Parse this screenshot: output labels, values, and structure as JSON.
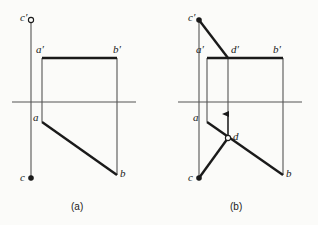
{
  "figure": {
    "background_color": "#fbfbf9",
    "ink_color": "#1a1a1a",
    "thin_line_color": "#555555",
    "captions": [
      {
        "text": "(a)",
        "x": 71,
        "y": 202
      },
      {
        "text": "(b)",
        "x": 230,
        "y": 202
      }
    ]
  },
  "panel_a": {
    "caption": "(a)",
    "labels": [
      {
        "name": "c-prime",
        "text": "c′",
        "x": 20,
        "y": 12
      },
      {
        "name": "a-prime",
        "text": "a′",
        "x": 36,
        "y": 44
      },
      {
        "name": "b-prime",
        "text": "b′",
        "x": 113,
        "y": 44
      },
      {
        "name": "a",
        "text": "a",
        "x": 33,
        "y": 112
      },
      {
        "name": "b",
        "text": "b",
        "x": 120,
        "y": 168
      },
      {
        "name": "c",
        "text": "c",
        "x": 20,
        "y": 172
      }
    ],
    "points": [
      {
        "name": "c-prime",
        "x": 31,
        "y": 20,
        "marker": "open-circle"
      },
      {
        "name": "a-prime",
        "x": 42,
        "y": 58,
        "marker": "none"
      },
      {
        "name": "b-prime",
        "x": 117,
        "y": 58,
        "marker": "none"
      },
      {
        "name": "a",
        "x": 42,
        "y": 122,
        "marker": "none"
      },
      {
        "name": "b",
        "x": 117,
        "y": 175,
        "marker": "none"
      },
      {
        "name": "c",
        "x": 31,
        "y": 178,
        "marker": "filled-circle"
      }
    ],
    "axis": {
      "name": "ground-line",
      "x1": 12,
      "y1": 102,
      "x2": 136,
      "y2": 102
    },
    "thin_lines": [
      {
        "name": "projector-c",
        "x1": 31,
        "y1": 20,
        "x2": 31,
        "y2": 178
      },
      {
        "name": "projector-a",
        "x1": 42,
        "y1": 58,
        "x2": 42,
        "y2": 122
      },
      {
        "name": "projector-b",
        "x1": 117,
        "y1": 58,
        "x2": 117,
        "y2": 175
      }
    ],
    "thick_lines": [
      {
        "name": "segment-a-prime-b-prime",
        "x1": 42,
        "y1": 58,
        "x2": 117,
        "y2": 58
      },
      {
        "name": "segment-a-b",
        "x1": 42,
        "y1": 122,
        "x2": 117,
        "y2": 175
      }
    ]
  },
  "panel_b": {
    "caption": "(b)",
    "labels": [
      {
        "name": "c-prime",
        "text": "c′",
        "x": 188,
        "y": 12
      },
      {
        "name": "a-prime",
        "text": "a′",
        "x": 196,
        "y": 44
      },
      {
        "name": "d-prime",
        "text": "d′",
        "x": 231,
        "y": 44
      },
      {
        "name": "b-prime",
        "text": "b′",
        "x": 273,
        "y": 44
      },
      {
        "name": "a",
        "text": "a",
        "x": 193,
        "y": 112
      },
      {
        "name": "d",
        "text": "d",
        "x": 233,
        "y": 131
      },
      {
        "name": "b",
        "text": "b",
        "x": 286,
        "y": 168
      },
      {
        "name": "c",
        "text": "c",
        "x": 188,
        "y": 172
      }
    ],
    "points": [
      {
        "name": "c-prime",
        "x": 199,
        "y": 20,
        "marker": "filled-circle"
      },
      {
        "name": "a-prime",
        "x": 207,
        "y": 58,
        "marker": "none"
      },
      {
        "name": "d-prime",
        "x": 228,
        "y": 58,
        "marker": "none"
      },
      {
        "name": "b-prime",
        "x": 283,
        "y": 58,
        "marker": "none"
      },
      {
        "name": "a",
        "x": 207,
        "y": 122,
        "marker": "none"
      },
      {
        "name": "d",
        "x": 228,
        "y": 138,
        "marker": "open-circle"
      },
      {
        "name": "b",
        "x": 283,
        "y": 175,
        "marker": "none"
      },
      {
        "name": "c",
        "x": 199,
        "y": 178,
        "marker": "filled-circle"
      }
    ],
    "axis": {
      "name": "ground-line",
      "x1": 178,
      "y1": 102,
      "x2": 302,
      "y2": 102
    },
    "thin_lines": [
      {
        "name": "projector-c",
        "x1": 199,
        "y1": 20,
        "x2": 199,
        "y2": 178
      },
      {
        "name": "projector-a",
        "x1": 207,
        "y1": 58,
        "x2": 207,
        "y2": 122
      },
      {
        "name": "projector-b",
        "x1": 283,
        "y1": 58,
        "x2": 283,
        "y2": 175
      },
      {
        "name": "projector-d",
        "x1": 228,
        "y1": 58,
        "x2": 228,
        "y2": 138
      }
    ],
    "thick_lines": [
      {
        "name": "segment-a-prime-b-prime",
        "x1": 207,
        "y1": 58,
        "x2": 283,
        "y2": 58
      },
      {
        "name": "segment-a-b",
        "x1": 207,
        "y1": 122,
        "x2": 283,
        "y2": 175
      },
      {
        "name": "segment-c-prime-d-prime",
        "x1": 199,
        "y1": 20,
        "x2": 228,
        "y2": 58
      },
      {
        "name": "segment-c-d",
        "x1": 199,
        "y1": 178,
        "x2": 228,
        "y2": 138
      }
    ],
    "arrows": [
      {
        "name": "projection-arrow-d-up",
        "x1": 228,
        "y1": 138,
        "x2": 228,
        "y2": 114
      }
    ]
  }
}
